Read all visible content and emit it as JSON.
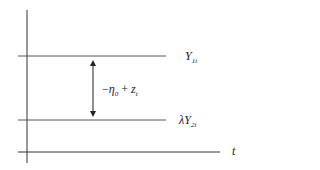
{
  "diagram": {
    "type": "level-lines",
    "axis_label": "t",
    "lines": [
      {
        "name": "upper",
        "label_main": "Y",
        "label_sub": "1t",
        "y": 56
      },
      {
        "name": "lower",
        "label_prefix": "λ",
        "label_main": "Y",
        "label_sub": "2t",
        "y": 120
      }
    ],
    "gap_label": {
      "minus": "−",
      "eta": "η",
      "eta_sub": "0",
      "plus": " + ",
      "z": "z",
      "z_sub": "t"
    },
    "colors": {
      "line": "#333333",
      "text": "#222222",
      "background": "#ffffff"
    }
  }
}
